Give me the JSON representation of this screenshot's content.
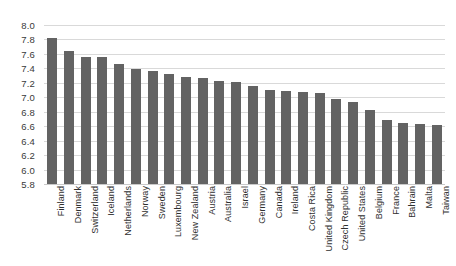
{
  "chart_data": {
    "type": "bar",
    "title": "",
    "subtitle": "",
    "xlabel": "",
    "ylabel": "",
    "ylim": [
      5.8,
      8.0
    ],
    "ytick_step": 0.2,
    "yticks": [
      "8.0",
      "7.8",
      "7.6",
      "7.4",
      "7.2",
      "7.0",
      "6.8",
      "6.6",
      "6.4",
      "6.2",
      "6.0",
      "5.8"
    ],
    "grid": true,
    "legend": "none",
    "bar_color": "#636363",
    "gridline_color": "#d9d9d9",
    "categories": [
      "Finland",
      "Denmark",
      "Switzerland",
      "Iceland",
      "Netherlands",
      "Norway",
      "Sweden",
      "Luxembourg",
      "New Zealand",
      "Austria",
      "Australia",
      "Israel",
      "Germany",
      "Canada",
      "Ireland",
      "Costa Rica",
      "United Kingdom",
      "Czech Republic",
      "United States",
      "Belgium",
      "France",
      "Bahrain",
      "Malta",
      "Taiwan"
    ],
    "values": [
      7.82,
      7.64,
      7.56,
      7.56,
      7.46,
      7.39,
      7.36,
      7.32,
      7.28,
      7.27,
      7.23,
      7.21,
      7.16,
      7.1,
      7.09,
      7.07,
      7.06,
      6.97,
      6.94,
      6.83,
      6.69,
      6.65,
      6.63,
      6.61
    ]
  }
}
